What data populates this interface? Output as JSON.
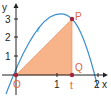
{
  "diagram": {
    "axes": {
      "x_label": "x",
      "y_label": "y",
      "x_ticks": [
        "1",
        "2"
      ],
      "y_ticks": [
        "1",
        "2",
        "3"
      ]
    },
    "curve": {
      "label": "f",
      "color": "#3a8fd0"
    },
    "points": {
      "origin": {
        "label": "O",
        "x": 0,
        "y": 0
      },
      "P": {
        "label": "P",
        "x": 1.4,
        "y": 2.9
      },
      "Q": {
        "label": "Q",
        "x": 1.4,
        "y": 0
      }
    },
    "t_label": "t",
    "triangle": {
      "vertices": [
        "O",
        "P",
        "Q"
      ],
      "fill": "#f7b48a"
    },
    "colors": {
      "point": "#a3243b",
      "label": "#d9653b",
      "axis": "#222222"
    }
  }
}
